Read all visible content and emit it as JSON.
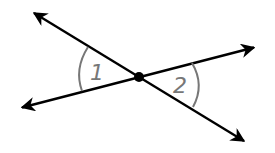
{
  "diagram": {
    "type": "vertical-angles",
    "intersection": {
      "x": 139,
      "y": 77
    },
    "lines": [
      {
        "name": "line-a",
        "from": {
          "x": 32,
          "y": 12
        },
        "to": {
          "x": 246,
          "y": 142
        }
      },
      {
        "name": "line-b",
        "from": {
          "x": 20,
          "y": 108
        },
        "to": {
          "x": 256,
          "y": 47
        }
      }
    ],
    "angles": [
      {
        "label": "1",
        "position": "left"
      },
      {
        "label": "2",
        "position": "right"
      }
    ],
    "colors": {
      "line": "#000000",
      "arc": "#777777",
      "label": "#777777"
    }
  }
}
